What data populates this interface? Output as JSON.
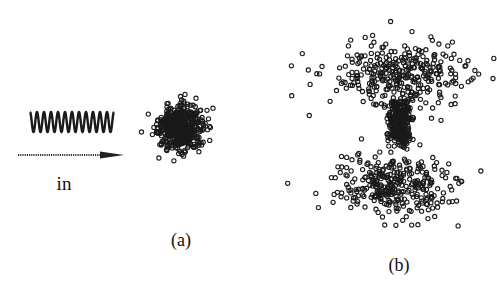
{
  "figure": {
    "incident_label": "in",
    "panels": [
      {
        "id": "a",
        "label": "(a)",
        "description": "isotropic cluster of scattered points"
      },
      {
        "id": "b",
        "label": "(b)",
        "description": "dipole-like scattering pattern with dense core and two diffuse lobes above and below"
      }
    ],
    "wave": {
      "type": "sinusoid",
      "cycles": 12
    },
    "colors": {
      "ink": "#1a1a1a",
      "background": "#ffffff"
    }
  },
  "chart_data": [
    {
      "type": "scatter",
      "panel": "a",
      "title": "(a)",
      "marker": "open-circle",
      "distribution": "gaussian-isotropic",
      "components": [
        {
          "name": "core",
          "count": 520,
          "spread_x": 1.0,
          "spread_y": 1.0
        }
      ]
    },
    {
      "type": "scatter",
      "panel": "b",
      "title": "(b)",
      "marker": "open-circle",
      "distribution": "dipole",
      "components": [
        {
          "name": "dense-core-upper",
          "count": 150,
          "spread_x": 0.35,
          "spread_y": 0.45
        },
        {
          "name": "dense-core-lower",
          "count": 150,
          "spread_x": 0.35,
          "spread_y": 0.45
        },
        {
          "name": "upper-lobe",
          "count": 330,
          "spread_x": 2.0,
          "spread_y": 0.9
        },
        {
          "name": "lower-lobe",
          "count": 330,
          "spread_x": 2.0,
          "spread_y": 0.9
        }
      ]
    }
  ]
}
